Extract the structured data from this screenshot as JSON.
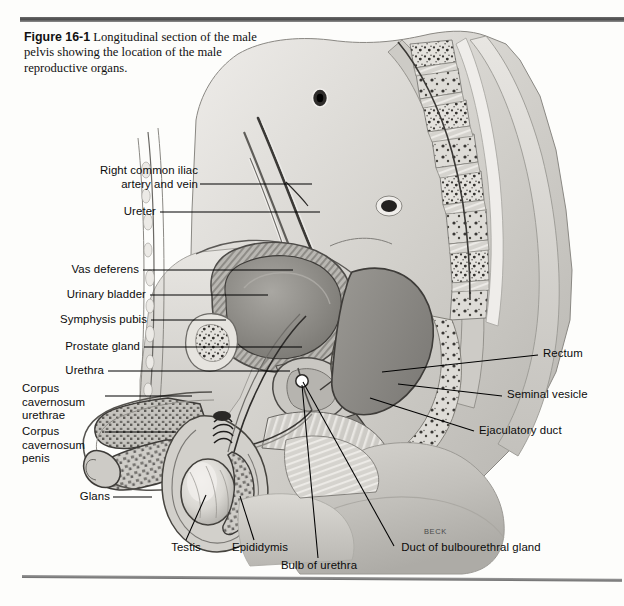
{
  "figure": {
    "number": "Figure 16-1",
    "caption": "Longitudinal section of the male pelvis showing the location of the male reproductive organs.",
    "artist_signature": "BECK"
  },
  "labels": {
    "left": [
      {
        "id": "right-common-iliac-artery-and-vein",
        "text": "Right common iliac\nartery and vein"
      },
      {
        "id": "ureter",
        "text": "Ureter"
      },
      {
        "id": "vas-deferens",
        "text": "Vas deferens"
      },
      {
        "id": "urinary-bladder",
        "text": "Urinary bladder"
      },
      {
        "id": "symphysis-pubis",
        "text": "Symphysis pubis"
      },
      {
        "id": "prostate-gland",
        "text": "Prostate gland"
      },
      {
        "id": "urethra",
        "text": "Urethra"
      },
      {
        "id": "corpus-cavernosum-urethrae",
        "text": "Corpus\ncavernosum\nurethrae"
      },
      {
        "id": "corpus-cavernosum-penis",
        "text": "Corpus\ncavernosum\npenis"
      },
      {
        "id": "glans",
        "text": "Glans"
      }
    ],
    "right": [
      {
        "id": "rectum",
        "text": "Rectum"
      },
      {
        "id": "seminal-vesicle",
        "text": "Seminal vesicle"
      },
      {
        "id": "ejaculatory-duct",
        "text": "Ejaculatory duct"
      }
    ],
    "bottom": [
      {
        "id": "testis",
        "text": "Testis"
      },
      {
        "id": "epididymis",
        "text": "Epididymis"
      },
      {
        "id": "bulb-of-urethra",
        "text": "Bulb of urethra"
      },
      {
        "id": "duct-of-bulbourethral-gland",
        "text": "Duct of bulbourethral gland"
      }
    ]
  },
  "colors": {
    "rule": "#4b4b4b",
    "leader_line": "#000000",
    "page_background": "#fdfdfb",
    "tissue_light": "#d9d7d2",
    "tissue_mid": "#b2b0ab",
    "tissue_dark": "#8a8883",
    "tissue_darker": "#6a6864",
    "bone": "#e2e0db",
    "lumen_dark": "#5e5c58"
  }
}
